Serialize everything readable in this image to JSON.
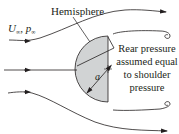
{
  "diagram": {
    "labels": {
      "hemisphere": "Hemisphere",
      "freestream_velocity": "U",
      "freestream_velocity_sub": "∞",
      "freestream_separator": ", ",
      "freestream_pressure": "p",
      "freestream_pressure_sub": "∞",
      "rear_pressure_line1": "Rear pressure",
      "rear_pressure_line2": "assumed equal",
      "rear_pressure_line3": "to shoulder",
      "rear_pressure_line4": "pressure",
      "radius": "a"
    },
    "colors": {
      "line": "#231f20",
      "hemisphere_fill": "#d1d3d4",
      "background": "#ffffff"
    },
    "elements": [
      "upper-streamline",
      "center-streamline",
      "lower-streamline",
      "upper-recirculation-curl",
      "lower-recirculation-curl",
      "hemisphere-body",
      "radius-dimension-arrow",
      "rear-pressure-pointer"
    ]
  }
}
